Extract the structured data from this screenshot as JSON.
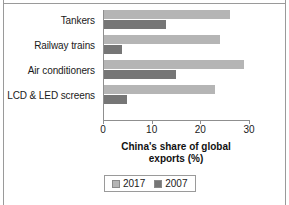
{
  "chart_data": {
    "type": "bar",
    "orientation": "horizontal",
    "title": "",
    "xlabel": "China's share of global exports (%)",
    "ylabel": "",
    "xlim": [
      0,
      30
    ],
    "xticks": [
      0,
      10,
      20,
      30
    ],
    "grid": false,
    "legend_position": "bottom",
    "categories": [
      "Tankers",
      "Railway trains",
      "Air conditioners",
      "LCD & LED screens"
    ],
    "series": [
      {
        "name": "2017",
        "color": "#b5b5b5",
        "values": [
          26,
          24,
          29,
          23
        ]
      },
      {
        "name": "2007",
        "color": "#767676",
        "values": [
          13,
          4,
          15,
          5
        ]
      }
    ]
  },
  "axis_title_lines": [
    "China's share of global",
    "exports (%)"
  ],
  "legend": {
    "items": [
      {
        "label": "2017",
        "color": "#b5b5b5"
      },
      {
        "label": "2007",
        "color": "#767676"
      }
    ]
  },
  "tick_labels": [
    "0",
    "10",
    "20",
    "30"
  ]
}
